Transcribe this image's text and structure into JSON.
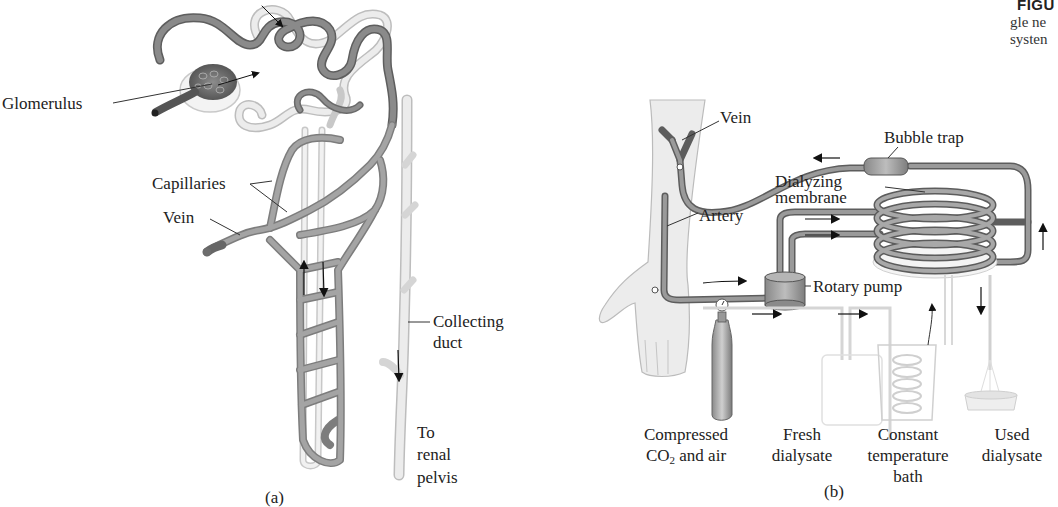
{
  "caption": {
    "heading_fragment": "FIGU",
    "line1_fragment": "gle ne",
    "line2_fragment": "systen"
  },
  "panel_a": {
    "label": "(a)",
    "title": "Nephron with surrounding capillaries",
    "labels": {
      "glomerulus": "Glomerulus",
      "capillaries": "Capillaries",
      "vein": "Vein",
      "collecting_duct_line1": "Collecting",
      "collecting_duct_line2": "duct",
      "renal_pelvis_line1": "To",
      "renal_pelvis_line2": "renal",
      "renal_pelvis_line3": "pelvis"
    },
    "colors": {
      "vessel": "#8a8a8a",
      "vessel_dark": "#5e5e5e",
      "tubule": "#e6e6e6",
      "tubule_edge": "#bdbdbd"
    }
  },
  "panel_b": {
    "label": "(b)",
    "title": "Artificial kidney dialysis apparatus",
    "labels": {
      "vein": "Vein",
      "bubble_trap": "Bubble trap",
      "dialyzing_membrane_line1": "Dialyzing",
      "dialyzing_membrane_line2": "membrane",
      "artery": "Artery",
      "rotary_pump": "Rotary pump",
      "compressed_line1": "Compressed",
      "compressed_line2_pre": "CO",
      "compressed_line2_sub": "2",
      "compressed_line2_post": " and air",
      "fresh_line1": "Fresh",
      "fresh_line2": "dialysate",
      "constant_line1": "Constant",
      "constant_line2": "temperature",
      "constant_line3": "bath",
      "used_line1": "Used",
      "used_line2": "dialysate"
    },
    "colors": {
      "tube": "#7a7a7a",
      "arm": "#ececec",
      "arm_edge": "#bbbbbb",
      "glass": "#d8d8d8"
    }
  }
}
